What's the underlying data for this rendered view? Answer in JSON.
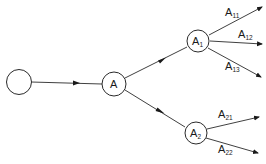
{
  "diagram": {
    "type": "tree",
    "nodes": [
      {
        "id": "root",
        "label": "",
        "sub": ""
      },
      {
        "id": "A",
        "label": "A",
        "sub": ""
      },
      {
        "id": "A1",
        "label": "A",
        "sub": "1"
      },
      {
        "id": "A2",
        "label": "A",
        "sub": "2"
      }
    ],
    "edges": [
      {
        "from": "root",
        "to": "A"
      },
      {
        "from": "A",
        "to": "A1"
      },
      {
        "from": "A",
        "to": "A2"
      }
    ],
    "leaf_edges": [
      {
        "from": "A1",
        "label": "A",
        "sub": "11"
      },
      {
        "from": "A1",
        "label": "A",
        "sub": "12"
      },
      {
        "from": "A1",
        "label": "A",
        "sub": "13"
      },
      {
        "from": "A2",
        "label": "A",
        "sub": "21"
      },
      {
        "from": "A2",
        "label": "A",
        "sub": "22"
      }
    ]
  }
}
